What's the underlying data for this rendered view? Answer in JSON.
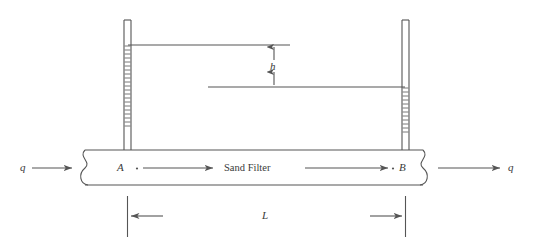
{
  "figure": {
    "type": "engineering-diagram",
    "background_color": "#ffffff",
    "line_color": "#555555",
    "text_color": "#3a3a3a"
  },
  "labels": {
    "inlet_flow": "q",
    "outlet_flow": "q",
    "point_a": "A",
    "point_b": "B",
    "filter_name": "Sand Filter",
    "head_loss": "h",
    "length": "L"
  },
  "components": {
    "pipe": {
      "name": "horizontal sand filter conduit",
      "left_break_symbol": true,
      "right_break_symbol": true
    },
    "piezometer_left": {
      "name": "left piezometer tube",
      "water_column_top": "high",
      "hatched": true
    },
    "piezometer_right": {
      "name": "right piezometer tube",
      "water_column_top": "low",
      "hatched": true
    },
    "head_line_upper": {
      "name": "upper piezometric head line"
    },
    "head_line_lower": {
      "name": "lower piezometric head line"
    },
    "dimension_length": {
      "name": "length dimension line",
      "double_headed": true
    }
  }
}
